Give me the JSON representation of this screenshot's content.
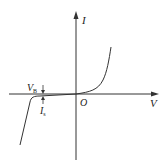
{
  "diagram": {
    "axes": {
      "x_label": "V",
      "y_label": "I",
      "origin_label": "O"
    },
    "annotations": {
      "breakdown_voltage": {
        "main": "V",
        "sub": "B"
      },
      "saturation_current": {
        "main": "I",
        "sub": "s"
      }
    },
    "colors": {
      "line": "#333333",
      "background": "#ffffff"
    }
  }
}
